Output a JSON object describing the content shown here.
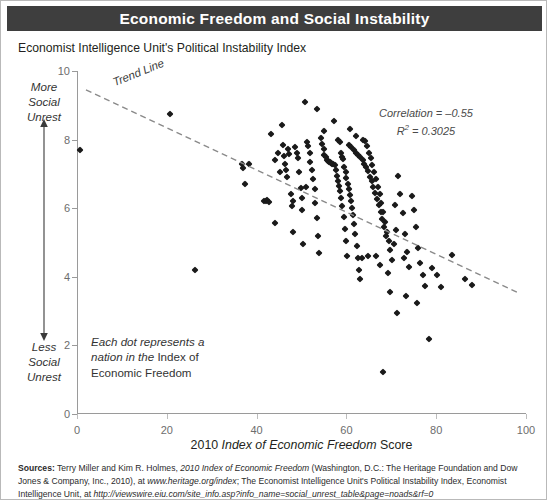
{
  "header": {
    "title": "Economic Freedom and Social Instability"
  },
  "subtitle": "Economist Intelligence Unit's Political Instability Index",
  "annotations": {
    "trend_label": "Trend Line",
    "correlation_line1": "Correlation = –0.55",
    "correlation_r2_prefix": "R",
    "correlation_r2_sup": "2",
    "correlation_r2_value": " = 0.3025",
    "note_line1": "Each dot represents a",
    "note_line2_it": "nation in the",
    "note_line2_rest": " Index of",
    "note_line3": "Economic Freedom",
    "more_label": "More\nSocial\nUnrest",
    "less_label": "Less\nSocial\nUnrest",
    "more_label_l1": "More",
    "more_label_l2": "Social",
    "more_label_l3": "Unrest",
    "less_label_l1": "Less",
    "less_label_l2": "Social",
    "less_label_l3": "Unrest"
  },
  "x_title": {
    "prefix": "2010 ",
    "italic": "Index of Economic Freedom",
    "suffix": " Score"
  },
  "sources": {
    "label": "Sources:",
    "line1_a": " Terry Miller and Kim R. Holmes, ",
    "line1_it": "2010 Index of Economic Freedom",
    "line1_b": " (Washington, D.C.: The Heritage Foundation and",
    "line2_a": "Dow Jones & Company, Inc., 2010), at ",
    "line2_it": "www.heritage.org/index",
    "line2_b": "; The Economist Intelligence Unit's Political Instability Index,",
    "line3_a": "Economist Intelligence Unit, at ",
    "line3_it": "http://viewswire.eiu.com/site_info.asp?info_name=social_unrest_table&page=noads&rf=0"
  },
  "chart_data": {
    "type": "scatter",
    "title": "Economic Freedom and Social Instability",
    "subtitle": "Economist Intelligence Unit's Political Instability Index",
    "xlabel": "2010 Index of Economic Freedom Score",
    "ylabel": "Economist Intelligence Unit's Political Instability Index",
    "xlim": [
      0,
      100
    ],
    "ylim": [
      0,
      10
    ],
    "xticks": [
      0,
      20,
      40,
      60,
      80,
      100
    ],
    "yticks": [
      0,
      2,
      4,
      6,
      8,
      10
    ],
    "grid": false,
    "legend": false,
    "correlation": -0.55,
    "r_squared": 0.3025,
    "trendline": {
      "type": "linear",
      "x_start": 2.0,
      "y_start": 9.45,
      "x_end": 98.0,
      "y_end": 3.55
    },
    "points": [
      [
        0.7,
        7.7
      ],
      [
        20.8,
        8.75
      ],
      [
        26.2,
        4.2
      ],
      [
        36.7,
        7.3
      ],
      [
        36.9,
        7.17
      ],
      [
        37.5,
        6.72
      ],
      [
        38.2,
        7.28
      ],
      [
        41.6,
        6.2
      ],
      [
        42.1,
        6.22
      ],
      [
        42.4,
        6.25
      ],
      [
        42.8,
        6.18
      ],
      [
        43.2,
        8.15
      ],
      [
        44.0,
        7.4
      ],
      [
        44.2,
        5.58
      ],
      [
        45.6,
        8.42
      ],
      [
        45.8,
        7.85
      ],
      [
        46.1,
        7.52
      ],
      [
        46.4,
        7.3
      ],
      [
        46.6,
        7.1
      ],
      [
        46.8,
        6.9
      ],
      [
        47.0,
        7.72
      ],
      [
        47.3,
        7.58
      ],
      [
        47.6,
        6.42
      ],
      [
        47.8,
        6.05
      ],
      [
        48.0,
        5.3
      ],
      [
        48.6,
        7.78
      ],
      [
        48.9,
        7.6
      ],
      [
        49.2,
        7.45
      ],
      [
        49.4,
        7.05
      ],
      [
        49.8,
        6.6
      ],
      [
        50.0,
        6.3
      ],
      [
        50.2,
        5.95
      ],
      [
        50.4,
        4.95
      ],
      [
        50.8,
        9.1
      ],
      [
        51.2,
        7.92
      ],
      [
        51.5,
        7.8
      ],
      [
        51.8,
        7.62
      ],
      [
        52.0,
        7.35
      ],
      [
        52.3,
        7.1
      ],
      [
        52.6,
        6.85
      ],
      [
        52.9,
        6.55
      ],
      [
        53.1,
        6.15
      ],
      [
        53.4,
        5.7
      ],
      [
        53.7,
        5.2
      ],
      [
        54.0,
        4.7
      ],
      [
        54.3,
        8.05
      ],
      [
        54.6,
        7.88
      ],
      [
        54.9,
        7.72
      ],
      [
        55.1,
        7.55
      ],
      [
        55.4,
        7.48
      ],
      [
        55.6,
        7.4
      ],
      [
        55.9,
        7.38
      ],
      [
        56.1,
        7.36
      ],
      [
        56.4,
        7.34
      ],
      [
        56.6,
        7.32
      ],
      [
        56.9,
        7.3
      ],
      [
        57.1,
        7.28
      ],
      [
        57.4,
        7.25
      ],
      [
        57.6,
        7.1
      ],
      [
        57.9,
        6.95
      ],
      [
        58.1,
        6.8
      ],
      [
        58.4,
        6.65
      ],
      [
        58.6,
        6.5
      ],
      [
        58.9,
        6.3
      ],
      [
        59.1,
        6.05
      ],
      [
        59.4,
        5.75
      ],
      [
        59.6,
        5.4
      ],
      [
        59.9,
        5.05
      ],
      [
        60.1,
        4.6
      ],
      [
        58.2,
        8.0
      ],
      [
        58.5,
        7.92
      ],
      [
        58.8,
        7.6
      ],
      [
        59.0,
        7.5
      ],
      [
        59.3,
        7.42
      ],
      [
        59.5,
        7.2
      ],
      [
        59.8,
        7.05
      ],
      [
        60.0,
        6.88
      ],
      [
        60.3,
        6.72
      ],
      [
        60.5,
        6.55
      ],
      [
        60.8,
        6.38
      ],
      [
        61.0,
        6.2
      ],
      [
        61.3,
        6.0
      ],
      [
        61.5,
        5.8
      ],
      [
        61.8,
        5.55
      ],
      [
        62.0,
        5.25
      ],
      [
        62.3,
        4.9
      ],
      [
        62.5,
        4.55
      ],
      [
        62.8,
        4.2
      ],
      [
        63.0,
        3.95
      ],
      [
        60.6,
        7.85
      ],
      [
        61.1,
        7.78
      ],
      [
        61.6,
        7.7
      ],
      [
        62.1,
        7.62
      ],
      [
        62.6,
        7.55
      ],
      [
        63.1,
        7.48
      ],
      [
        63.6,
        7.4
      ],
      [
        64.0,
        7.3
      ],
      [
        64.4,
        7.2
      ],
      [
        64.8,
        7.08
      ],
      [
        65.2,
        6.92
      ],
      [
        65.6,
        6.78
      ],
      [
        66.0,
        6.62
      ],
      [
        66.4,
        6.45
      ],
      [
        66.8,
        6.28
      ],
      [
        67.2,
        6.1
      ],
      [
        67.6,
        5.9
      ],
      [
        68.0,
        5.68
      ],
      [
        68.4,
        5.45
      ],
      [
        68.8,
        5.2
      ],
      [
        64.2,
        7.95
      ],
      [
        64.6,
        7.82
      ],
      [
        65.0,
        7.62
      ],
      [
        65.4,
        7.45
      ],
      [
        65.8,
        7.25
      ],
      [
        66.2,
        7.05
      ],
      [
        66.6,
        6.85
      ],
      [
        67.0,
        6.62
      ],
      [
        67.4,
        6.4
      ],
      [
        67.8,
        6.15
      ],
      [
        68.2,
        5.88
      ],
      [
        68.6,
        5.6
      ],
      [
        69.0,
        5.32
      ],
      [
        69.4,
        5.05
      ],
      [
        69.8,
        4.78
      ],
      [
        70.2,
        4.5
      ],
      [
        63.5,
        4.55
      ],
      [
        64.9,
        4.6
      ],
      [
        66.5,
        4.62
      ],
      [
        67.5,
        4.35
      ],
      [
        69.2,
        4.1
      ],
      [
        70.5,
        4.95
      ],
      [
        71.0,
        5.35
      ],
      [
        71.5,
        6.95
      ],
      [
        72.0,
        6.4
      ],
      [
        72.5,
        5.85
      ],
      [
        73.0,
        5.25
      ],
      [
        73.5,
        4.72
      ],
      [
        74.0,
        4.3
      ],
      [
        74.5,
        6.35
      ],
      [
        75.0,
        5.95
      ],
      [
        75.5,
        5.45
      ],
      [
        76.0,
        4.85
      ],
      [
        76.5,
        4.4
      ],
      [
        77.0,
        4.05
      ],
      [
        77.5,
        3.72
      ],
      [
        68.1,
        1.22
      ],
      [
        71.2,
        2.95
      ],
      [
        73.2,
        3.45
      ],
      [
        78.5,
        2.2
      ],
      [
        79.0,
        4.25
      ],
      [
        80.2,
        4.05
      ],
      [
        81.0,
        3.7
      ],
      [
        83.5,
        4.65
      ],
      [
        86.5,
        3.95
      ],
      [
        88.0,
        3.75
      ],
      [
        57.2,
        8.55
      ],
      [
        53.5,
        8.9
      ],
      [
        55.0,
        8.25
      ],
      [
        62.2,
        8.1
      ],
      [
        63.8,
        7.98
      ],
      [
        60.9,
        8.3
      ],
      [
        44.8,
        7.62
      ],
      [
        45.2,
        7.05
      ],
      [
        51.0,
        6.62
      ],
      [
        48.2,
        6.22
      ],
      [
        70.8,
        6.1
      ],
      [
        72.8,
        4.55
      ],
      [
        69.6,
        3.55
      ],
      [
        75.8,
        3.25
      ]
    ]
  }
}
